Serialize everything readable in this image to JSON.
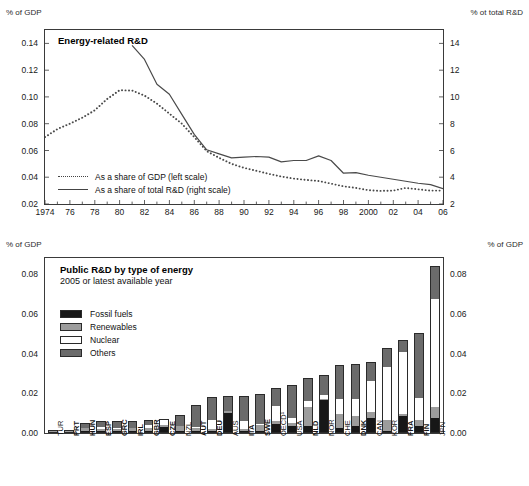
{
  "chart_data": [
    {
      "type": "line",
      "title": "Energy-related R&D",
      "axis_unit_left": "% of GDP",
      "axis_unit_right": "% ot total R&D",
      "xlabel": "",
      "ylabel": "% of GDP",
      "ylabel_right": "% ot total R&D",
      "ylim": [
        0.02,
        0.15
      ],
      "ylim_right": [
        2,
        15
      ],
      "ytick_labels": [
        "0.14",
        "0.12",
        "0.10",
        "0.08",
        "0.06",
        "0.04",
        "0.02"
      ],
      "ytick_values": [
        0.14,
        0.12,
        0.1,
        0.08,
        0.06,
        0.04,
        0.02
      ],
      "ytick_labels_right": [
        "14",
        "12",
        "10",
        "8",
        "6",
        "4",
        "2"
      ],
      "ytick_values_right": [
        14,
        12,
        10,
        8,
        6,
        4,
        2
      ],
      "xtick_labels": [
        "1974",
        "76",
        "78",
        "80",
        "82",
        "84",
        "86",
        "88",
        "90",
        "92",
        "94",
        "96",
        "98",
        "2000",
        "02",
        "04",
        "06"
      ],
      "xtick_values": [
        1974,
        1976,
        1978,
        1980,
        1982,
        1984,
        1986,
        1988,
        1990,
        1992,
        1994,
        1996,
        1998,
        2000,
        2002,
        2004,
        2006
      ],
      "xlim": [
        1974,
        2006
      ],
      "grid": false,
      "legend_position": "inside-lower-left",
      "series": [
        {
          "name": "As a share of GDP (left scale)",
          "style": "dotted",
          "axis": "left",
          "x": [
            1974,
            1975,
            1976,
            1977,
            1978,
            1979,
            1980,
            1981,
            1982,
            1983,
            1984,
            1985,
            1986,
            1987,
            1988,
            1989,
            1990,
            1991,
            1992,
            1993,
            1994,
            1995,
            1996,
            1997,
            1998,
            1999,
            2000,
            2001,
            2002,
            2003,
            2004,
            2005,
            2006
          ],
          "values": [
            0.07,
            0.076,
            0.08,
            0.0845,
            0.09,
            0.0985,
            0.105,
            0.1048,
            0.101,
            0.095,
            0.0875,
            0.08,
            0.07,
            0.0595,
            0.0545,
            0.05,
            0.047,
            0.0448,
            0.0425,
            0.0405,
            0.039,
            0.038,
            0.0372,
            0.0352,
            0.0332,
            0.032,
            0.0303,
            0.0298,
            0.03,
            0.032,
            0.031,
            0.03,
            0.03
          ]
        },
        {
          "name": "As a share of total R&D (right scale)",
          "style": "solid",
          "axis": "right",
          "x": [
            1981,
            1982,
            1983,
            1984,
            1985,
            1986,
            1987,
            1988,
            1989,
            1990,
            1991,
            1992,
            1993,
            1994,
            1995,
            1996,
            1997,
            1998,
            1999,
            2000,
            2001,
            2002,
            2003,
            2004,
            2005,
            2006
          ],
          "values": [
            13.85,
            12.8,
            10.95,
            10.2,
            8.7,
            7.2,
            6.05,
            5.75,
            5.45,
            5.5,
            5.55,
            5.5,
            5.15,
            5.25,
            5.25,
            5.6,
            5.25,
            4.3,
            4.35,
            4.15,
            4.0,
            3.85,
            3.7,
            3.55,
            3.45,
            3.15
          ]
        }
      ]
    },
    {
      "type": "bar",
      "subtype": "stacked",
      "title": "Public R&D by type of energy",
      "subtitle": "2005 or latest available year",
      "axis_unit_left": "% of GDP",
      "axis_unit_right": "% of GDP",
      "ylabel": "% of GDP",
      "ylim": [
        0,
        0.088
      ],
      "ytick_labels": [
        "0.08",
        "0.06",
        "0.04",
        "0.02",
        "0.00"
      ],
      "ytick_values": [
        0.08,
        0.06,
        0.04,
        0.02,
        0.0
      ],
      "grid": false,
      "legend_position": "inside-upper-left",
      "categories": [
        "TUR",
        "PRT",
        "HUN",
        "ESP",
        "GRC",
        "IRL",
        "GBR",
        "CZE",
        "NZL",
        "AUT",
        "DEU",
        "AUS",
        "ITA",
        "SWE",
        "OECD¹",
        "USA",
        "NLD",
        "NOR",
        "CHE",
        "DNK",
        "CAN",
        "KOR",
        "FRA",
        "FIN",
        "JPN"
      ],
      "categories_bold": [
        false,
        true,
        true,
        true,
        true,
        true,
        true,
        true,
        false,
        true,
        true,
        false,
        true,
        true,
        false,
        false,
        true,
        false,
        false,
        true,
        false,
        false,
        true,
        true,
        false
      ],
      "series": [
        {
          "name": "Fossil fuels",
          "color": "#171717",
          "values": [
            0.0,
            0.0,
            0.0002,
            0.0002,
            0.0002,
            0.0003,
            0.0002,
            0.0024,
            0.0004,
            0.0004,
            0.0004,
            0.0097,
            0.0003,
            0.0003,
            0.004,
            0.0032,
            0.0028,
            0.0162,
            0.0018,
            0.0032,
            0.007,
            0.0003,
            0.008,
            0.0032,
            0.007
          ]
        },
        {
          "name": "Renewables",
          "color": "#9c9c9c",
          "values": [
            0.0002,
            0.0005,
            0.0015,
            0.0012,
            0.0014,
            0.0016,
            0.0016,
            0.0013,
            0.0028,
            0.0014,
            0.0013,
            0.0008,
            0.001,
            0.0033,
            0.0017,
            0.0012,
            0.01,
            0.0006,
            0.0074,
            0.0048,
            0.003,
            0.0058,
            0.0009,
            0.003,
            0.0055
          ]
        },
        {
          "name": "Nuclear",
          "color": "#ffffff",
          "values": [
            0.0,
            0.0,
            0.0004,
            0.001,
            0.0004,
            0.0,
            0.0015,
            0.0023,
            0.0,
            0.0009,
            0.0044,
            0.0001,
            0.004,
            0.0003,
            0.0072,
            0.0025,
            0.0029,
            0.0019,
            0.0074,
            0.0086,
            0.0155,
            0.0265,
            0.0311,
            0.011,
            0.0542
          ]
        },
        {
          "name": "Others",
          "color": "#6b6b6b",
          "values": [
            0.0002,
            0.0007,
            0.0024,
            0.0028,
            0.0033,
            0.0038,
            0.0025,
            0.0008,
            0.0053,
            0.011,
            0.0114,
            0.0072,
            0.0129,
            0.0151,
            0.0091,
            0.017,
            0.0113,
            0.0098,
            0.017,
            0.0174,
            0.0095,
            0.0095,
            0.0065,
            0.0325,
            0.0169
          ]
        }
      ]
    }
  ],
  "top": {
    "unit_left": "% of GDP",
    "unit_right": "% ot total R&D",
    "title": "Energy-related R&D",
    "legend": [
      {
        "label": "As a share of GDP (left scale)",
        "style": "dotted"
      },
      {
        "label": "As a share of total R&D (right scale)",
        "style": "solid"
      }
    ]
  },
  "bottom": {
    "unit_left": "% of GDP",
    "unit_right": "% of GDP",
    "title": "Public R&D by type of energy",
    "subtitle": "2005 or latest available year",
    "legend": [
      {
        "label": "Fossil fuels",
        "color": "#171717"
      },
      {
        "label": "Renewables",
        "color": "#9c9c9c"
      },
      {
        "label": "Nuclear",
        "color": "#ffffff"
      },
      {
        "label": "Others",
        "color": "#6b6b6b"
      }
    ]
  }
}
